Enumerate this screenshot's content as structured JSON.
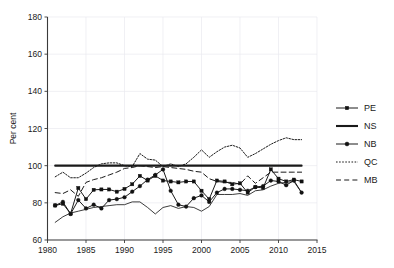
{
  "figure": {
    "title_fragment": "",
    "background": "#ffffff",
    "ink_color": "#1a1a1a",
    "grid_color": "#e9e9ef"
  },
  "axes": {
    "y_title": "Per cent",
    "y_ticks": [
      "60",
      "80",
      "100",
      "120",
      "140",
      "160",
      "180"
    ],
    "x_ticks": [
      "1980",
      "1985",
      "1990",
      "1995",
      "2000",
      "2005",
      "2010",
      "2015"
    ]
  },
  "legend": {
    "entries": [
      {
        "label": "PE",
        "style": "line-marker-square"
      },
      {
        "label": "NS",
        "style": "line-thick-solid"
      },
      {
        "label": "NB",
        "style": "line-marker-dot"
      },
      {
        "label": "QC",
        "style": "line-dotted"
      },
      {
        "label": "MB",
        "style": "line-dashed"
      }
    ]
  },
  "chart_data": {
    "type": "line",
    "title": "",
    "xlabel": "",
    "ylabel": "Per cent",
    "xlim": [
      1980,
      2015
    ],
    "ylim": [
      60,
      180
    ],
    "yticks": [
      60,
      80,
      100,
      120,
      140,
      160,
      180
    ],
    "xticks": [
      1980,
      1985,
      1990,
      1995,
      2000,
      2005,
      2010,
      2015
    ],
    "grid": true,
    "legend_position": "right",
    "x": [
      1981,
      1982,
      1983,
      1984,
      1985,
      1986,
      1987,
      1988,
      1989,
      1990,
      1991,
      1992,
      1993,
      1994,
      1995,
      1996,
      1997,
      1998,
      1999,
      2000,
      2001,
      2002,
      2003,
      2004,
      2005,
      2006,
      2007,
      2008,
      2009,
      2010,
      2011,
      2012,
      2013
    ],
    "series": [
      {
        "name": "PE",
        "marker": "square",
        "linestyle": "solid",
        "values": [
          78.6,
          79.5,
          74.2,
          88.0,
          82.0,
          87.0,
          87.2,
          87.2,
          86.0,
          87.5,
          90.0,
          94.5,
          92.0,
          94.5,
          92.0,
          91.5,
          91.0,
          91.5,
          91.5,
          86.5,
          82.0,
          92.0,
          91.5,
          90.0,
          90.5,
          85.5,
          88.5,
          88.0,
          98.0,
          93.0,
          91.5,
          92.5,
          91.5
        ]
      },
      {
        "name": "NS",
        "marker": "none",
        "linestyle": "solid-thick",
        "values": [
          100,
          100,
          100,
          100,
          100,
          100,
          100,
          100,
          100,
          100,
          100,
          100,
          100,
          100,
          100,
          100,
          100,
          100,
          100,
          100,
          100,
          100,
          100,
          100,
          100,
          100,
          100,
          100,
          100,
          100,
          100,
          100,
          100
        ]
      },
      {
        "name": "NB",
        "marker": "dot",
        "linestyle": "solid",
        "values": [
          78.6,
          80.5,
          74.0,
          81.5,
          77.0,
          79.0,
          77.0,
          81.5,
          82.0,
          83.0,
          86.0,
          89.0,
          92.5,
          95.0,
          98.0,
          86.5,
          79.0,
          78.0,
          82.5,
          84.0,
          80.5,
          85.5,
          87.5,
          87.5,
          87.0,
          86.5,
          88.5,
          89.0,
          92.0,
          91.5,
          89.5,
          92.0,
          85.5
        ]
      },
      {
        "name": "QC",
        "marker": "none",
        "linestyle": "dotted",
        "values": [
          94.0,
          96.5,
          93.5,
          93.5,
          96.0,
          99.0,
          101.0,
          101.5,
          101.5,
          100.0,
          99.5,
          106.5,
          103.5,
          103.0,
          99.5,
          101.0,
          99.5,
          101.0,
          104.5,
          108.5,
          104.5,
          107.5,
          110.0,
          111.0,
          109.5,
          104.5,
          106.5,
          109.0,
          111.5,
          113.5,
          115.0,
          114.0,
          114.0
        ]
      },
      {
        "name": "MB",
        "marker": "none",
        "linestyle": "dashed",
        "values": [
          85.5,
          85.0,
          87.0,
          83.5,
          91.0,
          92.5,
          93.5,
          95.0,
          96.5,
          98.5,
          99.0,
          100.0,
          99.5,
          99.0,
          99.5,
          99.0,
          98.5,
          98.0,
          97.0,
          96.5,
          93.0,
          91.5,
          91.0,
          91.0,
          90.0,
          94.5,
          90.5,
          93.5,
          96.5,
          96.5,
          96.5,
          96.5,
          96.5
        ]
      },
      {
        "name": "SK",
        "marker": "none",
        "linestyle": "solid-thin",
        "values": [
          69.5,
          72.5,
          74.5,
          75.5,
          76.5,
          77.5,
          78.0,
          78.5,
          79.0,
          79.0,
          80.5,
          80.5,
          77.5,
          74.0,
          77.5,
          78.5,
          77.0,
          78.0,
          77.5,
          75.5,
          78.0,
          84.5,
          84.5,
          84.5,
          85.0,
          84.0,
          86.5,
          87.0,
          89.0,
          90.5,
          91.0,
          91.5,
          85.5
        ]
      }
    ]
  }
}
